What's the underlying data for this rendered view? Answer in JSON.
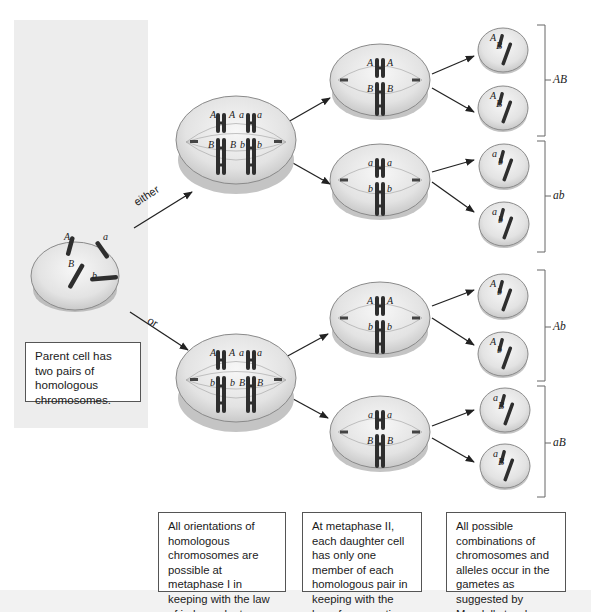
{
  "arrow_labels": {
    "either": "either",
    "or": "or"
  },
  "parent_cell": {
    "caption": "Parent cell has two pairs of homologous chromosomes.",
    "alleles": [
      "A",
      "a",
      "B",
      "b"
    ]
  },
  "metaphase_I": [
    {
      "branch": "either",
      "top_row": [
        "A",
        "A",
        "a",
        "a"
      ],
      "bottom_row": [
        "B",
        "B",
        "b",
        "b"
      ]
    },
    {
      "branch": "or",
      "top_row": [
        "A",
        "A",
        "a",
        "a"
      ],
      "bottom_row": [
        "b",
        "b",
        "B",
        "B"
      ]
    }
  ],
  "metaphase_II": [
    {
      "top": [
        "A",
        "A"
      ],
      "bottom": [
        "B",
        "B"
      ]
    },
    {
      "top": [
        "a",
        "a"
      ],
      "bottom": [
        "b",
        "b"
      ]
    },
    {
      "top": [
        "A",
        "A"
      ],
      "bottom": [
        "b",
        "b"
      ]
    },
    {
      "top": [
        "a",
        "a"
      ],
      "bottom": [
        "B",
        "B"
      ]
    }
  ],
  "gametes": [
    {
      "alleles": [
        "A",
        "B"
      ]
    },
    {
      "alleles": [
        "A",
        "B"
      ]
    },
    {
      "alleles": [
        "a",
        "b"
      ]
    },
    {
      "alleles": [
        "a",
        "b"
      ]
    },
    {
      "alleles": [
        "A",
        "b"
      ]
    },
    {
      "alleles": [
        "A",
        "b"
      ]
    },
    {
      "alleles": [
        "a",
        "B"
      ]
    },
    {
      "alleles": [
        "a",
        "B"
      ]
    }
  ],
  "gamete_group_labels": [
    "AB",
    "ab",
    "Ab",
    "aB"
  ],
  "captions": {
    "metaphase_I": "All orientations of homologous chromosomes are possible at metaphase I in keeping with the law of independent assortment.",
    "metaphase_II": "At metaphase II, each daughter cell has only one member of each homologous pair in keeping with the law of segregation.",
    "gametes": "All possible combinations of chromosomes and alleles occur in the gametes as suggested by Mendel's two laws."
  },
  "colors": {
    "chromosome": "#2e2e2e",
    "cell_fill": "#e6e6e6",
    "cell_edge": "#8a8a8a",
    "panel": "#ededed"
  }
}
